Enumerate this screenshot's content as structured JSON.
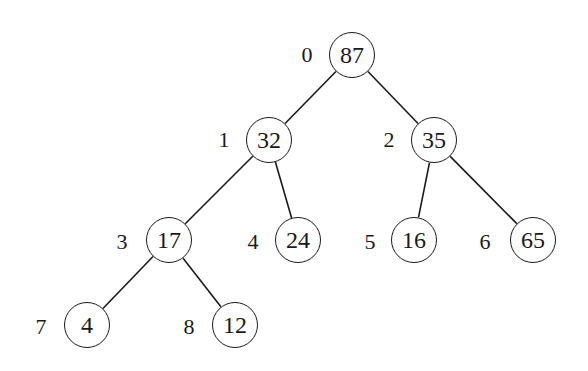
{
  "diagram": {
    "type": "binary-heap-tree",
    "nodes": [
      {
        "index": "0",
        "value": "87",
        "x": 352,
        "y": 55
      },
      {
        "index": "1",
        "value": "32",
        "x": 269,
        "y": 140
      },
      {
        "index": "2",
        "value": "35",
        "x": 434,
        "y": 140
      },
      {
        "index": "3",
        "value": "17",
        "x": 169,
        "y": 240
      },
      {
        "index": "4",
        "value": "24",
        "x": 298,
        "y": 240
      },
      {
        "index": "5",
        "value": "16",
        "x": 414,
        "y": 240
      },
      {
        "index": "6",
        "value": "65",
        "x": 533,
        "y": 240
      },
      {
        "index": "7",
        "value": "4",
        "x": 87,
        "y": 325
      },
      {
        "index": "8",
        "value": "12",
        "x": 235,
        "y": 325
      }
    ],
    "edges": [
      [
        0,
        1
      ],
      [
        0,
        2
      ],
      [
        1,
        3
      ],
      [
        1,
        4
      ],
      [
        2,
        5
      ],
      [
        2,
        6
      ],
      [
        3,
        7
      ],
      [
        3,
        8
      ]
    ]
  }
}
